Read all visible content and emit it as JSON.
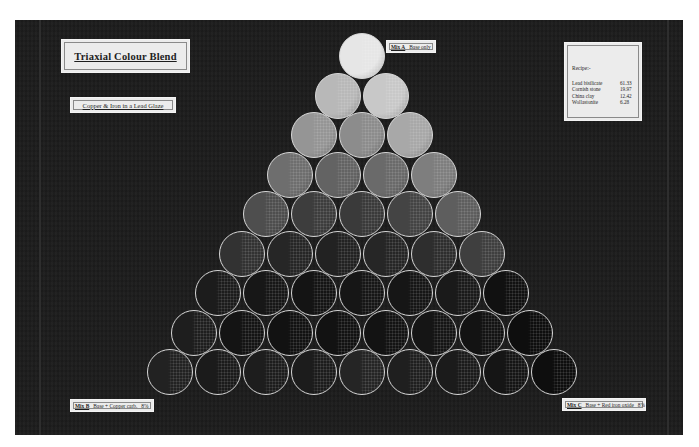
{
  "board": {
    "background": "#1c1c1c",
    "title": "Triaxial Colour Blend",
    "subtitle": "Copper & Iron in a Lead Glaze"
  },
  "recipe": {
    "heading": "Recipe:-",
    "items": [
      {
        "name": "Lead bisilicate",
        "value": "61.33"
      },
      {
        "name": "Cornish stone",
        "value": "19.97"
      },
      {
        "name": "China clay",
        "value": "12.42"
      },
      {
        "name": "Wollastonite",
        "value": "6.28"
      }
    ]
  },
  "corners": {
    "mix_a": {
      "key": "Mix A",
      "desc": "Base only",
      "suffix": ""
    },
    "mix_b": {
      "key": "Mix B",
      "desc": "Base + Copper carb.",
      "suffix": "8%"
    },
    "mix_c": {
      "key": "Mix C",
      "desc": "Base + Red iron oxide",
      "suffix": "8%"
    }
  },
  "triangle": {
    "rows": 9,
    "tile_diameter": 46,
    "row_spacing": 39.5,
    "apex": {
      "x": 362,
      "y": 56
    },
    "tones": [
      [
        "#e6e6e6"
      ],
      [
        "#b8b8b8",
        "#c8c8c8"
      ],
      [
        "#959595",
        "#8c8c8c",
        "#a8a8a8"
      ],
      [
        "#6e6e6e",
        "#636363",
        "#6a6a6a",
        "#7e7e7e"
      ],
      [
        "#4e4e4e",
        "#3d3d3d",
        "#3a3a3a",
        "#444444",
        "#5e5e5e"
      ],
      [
        "#323232",
        "#262626",
        "#222222",
        "#262626",
        "#2e2e2e",
        "#3f3f3f"
      ],
      [
        "#1c1c1c",
        "#171717",
        "#141414",
        "#161616",
        "#161616",
        "#1a1a1a",
        "#111111"
      ],
      [
        "#1e1e1e",
        "#141414",
        "#121212",
        "#121212",
        "#131313",
        "#151515",
        "#131313",
        "#0e0e0e"
      ],
      [
        "#222222",
        "#1b1b1b",
        "#1d1d1d",
        "#1c1c1c",
        "#252525",
        "#1f1f1f",
        "#1b1b1b",
        "#151515",
        "#0e0e0e"
      ]
    ]
  }
}
